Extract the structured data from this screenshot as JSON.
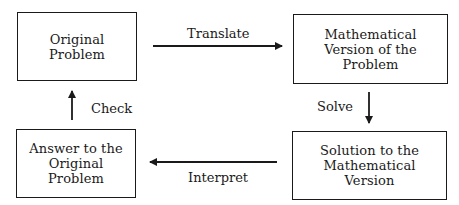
{
  "diagram": {
    "type": "flowchart-cycle",
    "nodes": [
      {
        "id": "original",
        "label": "Original\nProblem"
      },
      {
        "id": "math_version",
        "label": "Mathematical\nVersion of the\nProblem"
      },
      {
        "id": "solution",
        "label": "Solution to the\nMathematical\nVersion"
      },
      {
        "id": "answer",
        "label": "Answer to the\nOriginal\nProblem"
      }
    ],
    "edges": [
      {
        "from": "original",
        "to": "math_version",
        "label": "Translate"
      },
      {
        "from": "math_version",
        "to": "solution",
        "label": "Solve"
      },
      {
        "from": "solution",
        "to": "answer",
        "label": "Interpret"
      },
      {
        "from": "answer",
        "to": "original",
        "label": "Check"
      }
    ],
    "colors": {
      "stroke": "#1a1a1a",
      "background": "#ffffff"
    }
  }
}
